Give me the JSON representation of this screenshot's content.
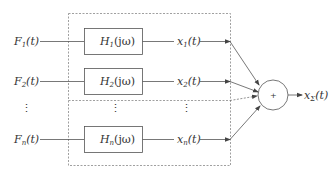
{
  "diagram": {
    "colors": {
      "line": "#555555",
      "dashed": "#888888",
      "text": "#333333"
    },
    "inputs": [
      {
        "base": "F",
        "sub": "1",
        "arg": "(t)"
      },
      {
        "base": "F",
        "sub": "2",
        "arg": "(t)"
      },
      {
        "base": "F",
        "sub": "n",
        "arg": "(t)"
      }
    ],
    "filters": [
      {
        "base": "H",
        "sub": "1",
        "arg": "(jω)"
      },
      {
        "base": "H",
        "sub": "2",
        "arg": "(jω)"
      },
      {
        "base": "H",
        "sub": "n",
        "arg": "(jω)"
      }
    ],
    "outputs": [
      {
        "base": "x",
        "sub": "1",
        "arg": "(t)"
      },
      {
        "base": "x",
        "sub": "2",
        "arg": "(t)"
      },
      {
        "base": "x",
        "sub": "n",
        "arg": "(t)"
      }
    ],
    "ellipsis": "⋮",
    "summer": {
      "symbol": "+"
    },
    "result": {
      "base": "x",
      "sub": "Σ",
      "arg": "(t)"
    }
  }
}
